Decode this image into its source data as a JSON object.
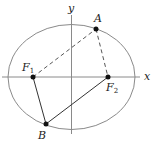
{
  "diagram": {
    "type": "ellipse-foci",
    "colors": {
      "ellipse": "#8a8a8a",
      "axes": "#8a8a8a",
      "lines": "#333333",
      "points": "#111111",
      "background": "#ffffff"
    },
    "axes": {
      "x_label": "x",
      "y_label": "y"
    },
    "ellipse": {
      "cx": 71.5,
      "cy": 77,
      "rx": 63.5,
      "ry": 52.5
    },
    "points": {
      "A": {
        "label": "A",
        "x": 96,
        "y": 29
      },
      "B": {
        "label": "B",
        "x": 46,
        "y": 124
      },
      "F1": {
        "label": "F",
        "sub": "1",
        "x": 33,
        "y": 77
      },
      "F2": {
        "label": "F",
        "sub": "2",
        "x": 108,
        "y": 77
      }
    },
    "segments": [
      {
        "from": "F1",
        "to": "A",
        "style": "dashed"
      },
      {
        "from": "A",
        "to": "F2",
        "style": "dashed"
      },
      {
        "from": "F1",
        "to": "B",
        "style": "solid"
      },
      {
        "from": "B",
        "to": "F2",
        "style": "solid"
      }
    ]
  }
}
